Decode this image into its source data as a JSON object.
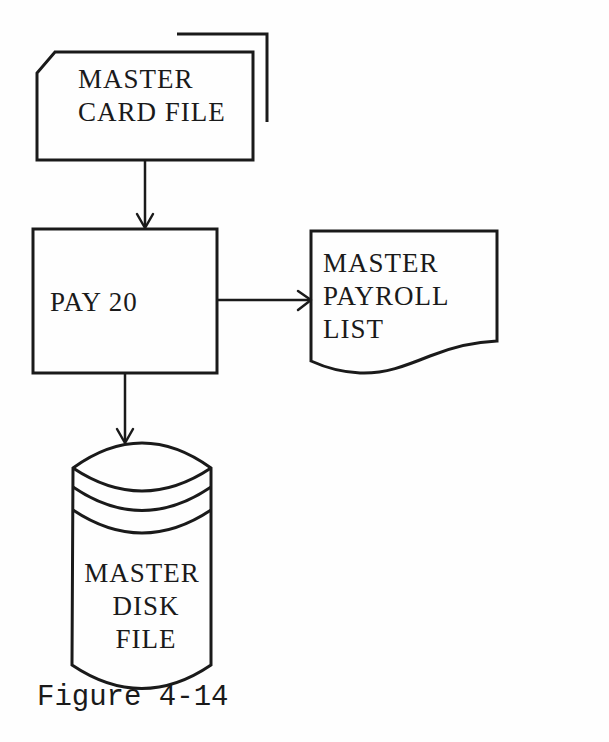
{
  "figure": {
    "caption": "Figure 4-14",
    "type": "system flowchart"
  },
  "nodes": {
    "card_file": {
      "shape": "punched-card-deck",
      "lines": [
        "MASTER",
        "CARD FILE"
      ]
    },
    "process": {
      "shape": "process-rectangle",
      "lines": [
        "PAY 20"
      ]
    },
    "report": {
      "shape": "document",
      "lines": [
        "MASTER",
        "PAYROLL",
        "LIST"
      ]
    },
    "disk_file": {
      "shape": "magnetic-disk",
      "lines": [
        "MASTER",
        "DISK",
        "FILE"
      ]
    }
  },
  "edges": [
    {
      "from": "card_file",
      "to": "process",
      "direction": "down"
    },
    {
      "from": "process",
      "to": "report",
      "direction": "right"
    },
    {
      "from": "process",
      "to": "disk_file",
      "direction": "down"
    }
  ],
  "colors": {
    "ink": "#1a1a1a",
    "paper": "#fefefe"
  }
}
